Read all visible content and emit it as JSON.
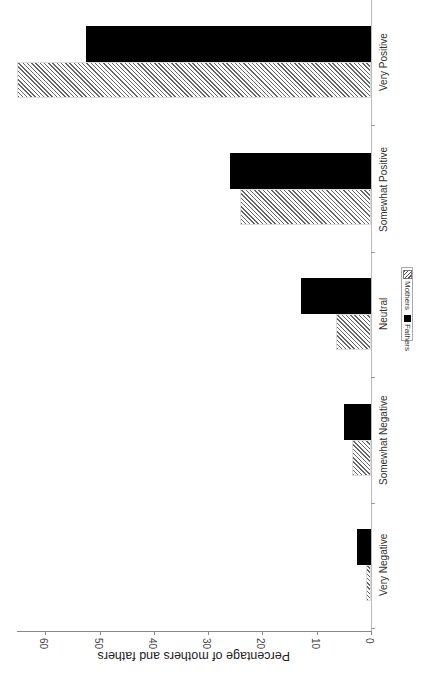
{
  "chart_data": {
    "type": "bar",
    "orientation": "rotated-90-clockwise",
    "title": "",
    "xlabel": "",
    "ylabel": "Percentage of mothers and fathers",
    "categories": [
      "Very Negative",
      "Somewhat Negative",
      "Neutral",
      "Somewhat Positive",
      "Very Positive"
    ],
    "series": [
      {
        "name": "Mothers",
        "pattern": "hatched",
        "values": [
          1.0,
          3.5,
          6.4,
          24.1,
          65.2
        ]
      },
      {
        "name": "Fathers",
        "pattern": "solid",
        "color": "#000000",
        "values": [
          2.5,
          5.0,
          12.9,
          26.0,
          52.5
        ]
      }
    ],
    "yticks": [
      0,
      10,
      20,
      30,
      40,
      50,
      60
    ],
    "ylim": [
      0,
      65
    ],
    "grid": false,
    "legend_position": "center-right"
  },
  "legend": {
    "mothers": "Mothers",
    "fathers": "Fathers"
  }
}
